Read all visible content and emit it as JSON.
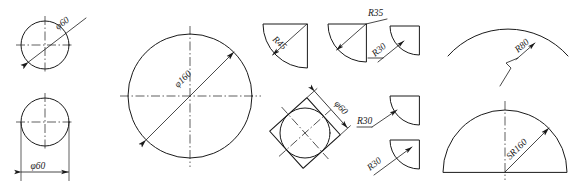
{
  "drawing": {
    "title": "Dimensioning of diameters, radii and spherical radii",
    "background_color": "#ffffff",
    "line_color": "#1a1a1a",
    "figures": [
      {
        "id": "fig-circle-diameter-inside",
        "name": "circle-with-internal-diameter-leader",
        "shape": "circle",
        "label": "φ60",
        "dimension_type": "diameter",
        "value": 60,
        "leader_style": "oblique-through-center-double-arrow"
      },
      {
        "id": "fig-circle-diameter-linear",
        "name": "circle-with-linear-diameter-dimension",
        "shape": "circle",
        "label": "φ60",
        "dimension_type": "diameter",
        "value": 60,
        "leader_style": "linear-dimension-below-with-extension-lines"
      },
      {
        "id": "fig-large-circle",
        "name": "large-circle-with-diameter",
        "shape": "circle",
        "label": "φ160",
        "dimension_type": "diameter",
        "value": 160,
        "leader_style": "oblique-through-center-double-arrow"
      },
      {
        "id": "fig-sector-r45",
        "name": "quarter-sector-radius-r45",
        "shape": "sector",
        "label": "R45",
        "dimension_type": "radius",
        "value": 45,
        "leader_style": "radial-arrow-text-along-leader"
      },
      {
        "id": "fig-sector-r35",
        "name": "quarter-sector-radius-r35",
        "shape": "sector",
        "label": "R35",
        "dimension_type": "radius",
        "value": 35,
        "leader_style": "radial-arrow-horizontal-shelf"
      },
      {
        "id": "fig-sector-r30-top",
        "name": "quarter-sector-radius-r30-top",
        "shape": "sector",
        "label": "R30",
        "dimension_type": "radius",
        "value": 30,
        "leader_style": "external-oblique-leader-text-rotated"
      },
      {
        "id": "fig-square-circle",
        "name": "rotated-square-with-inscribed-circle",
        "shape": "circle-in-rotated-square",
        "label": "φ60",
        "dimension_type": "diameter",
        "value": 60,
        "leader_style": "offset-dimension-line-parallel-to-square-edge"
      },
      {
        "id": "fig-sector-r30-mid",
        "name": "quarter-sector-radius-r30-middle",
        "shape": "sector",
        "label": "R30",
        "dimension_type": "radius",
        "value": 30,
        "leader_style": "external-leader-horizontal-shelf-left"
      },
      {
        "id": "fig-sector-r30-bottom",
        "name": "quarter-sector-radius-r30-bottom",
        "shape": "sector",
        "label": "R30",
        "dimension_type": "radius",
        "value": 30,
        "leader_style": "external-oblique-leader-text-rotated"
      },
      {
        "id": "fig-arc-r80",
        "name": "shallow-arc-radius-r80",
        "shape": "arc",
        "label": "R80",
        "dimension_type": "radius",
        "value": 80,
        "leader_style": "jogged-zigzag-radial-leader"
      },
      {
        "id": "fig-dome-sr160",
        "name": "semicircular-dome-spherical-radius",
        "shape": "semicircle",
        "label": "SR160",
        "dimension_type": "spherical-radius",
        "value": 160,
        "leader_style": "radial-arrow-from-center-text-along-leader"
      }
    ]
  }
}
